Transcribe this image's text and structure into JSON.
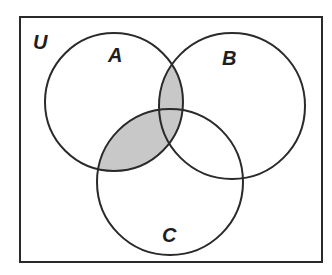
{
  "diagram": {
    "type": "venn",
    "universe_label": "U",
    "sets": [
      {
        "label": "A",
        "cx": 114,
        "cy": 102,
        "r": 69
      },
      {
        "label": "B",
        "cx": 232,
        "cy": 106,
        "r": 73
      },
      {
        "label": "C",
        "cx": 170,
        "cy": 182,
        "r": 73
      }
    ],
    "shaded_region": "(A ∩ B) ∪ (A ∩ C)",
    "shade_color": "#c8c8c8",
    "line_color": "#2a2a2a"
  }
}
